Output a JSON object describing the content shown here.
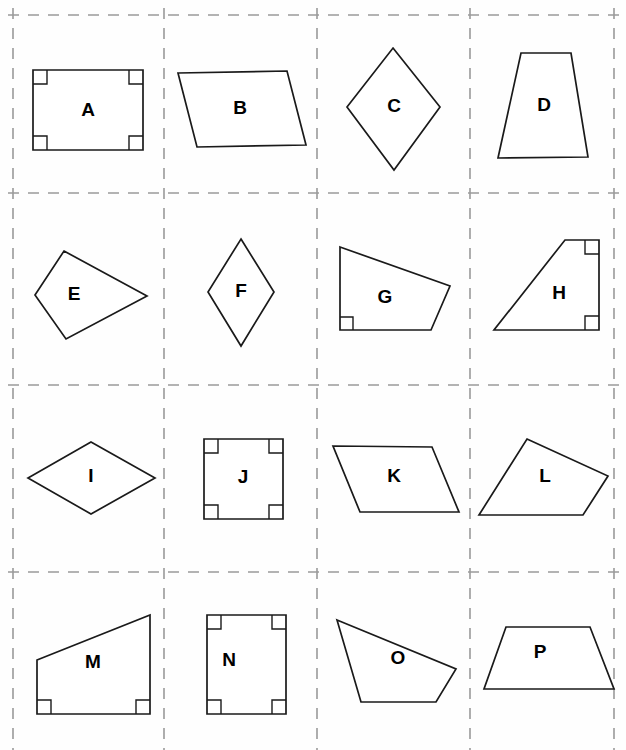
{
  "worksheet": {
    "title": "Quadrilateral shapes worksheet",
    "width": 626,
    "height": 750,
    "background_color": "#fefefe",
    "shape_stroke_color": "#1a1a1a",
    "shape_fill_color": "#ffffff",
    "grid_color": "#9a9a9a",
    "grid": {
      "columns": 4,
      "rows": 4,
      "style": "dashed",
      "vertical_lines_x": [
        13,
        164,
        317,
        470,
        614
      ],
      "horizontal_lines_y": [
        15,
        193,
        385,
        572,
        752
      ]
    }
  },
  "cells": [
    {
      "label": "A",
      "shape_name": "rectangle",
      "label_x": 88,
      "label_y": 111,
      "points": "33,70 143,70 143,150 33,150",
      "right_angles": [
        "33,84 47,84 47,70",
        "129,70 129,84 143,84",
        "33,136 47,136 47,150",
        "129,150 129,136 143,136"
      ]
    },
    {
      "label": "B",
      "shape_name": "parallelogram",
      "label_x": 240,
      "label_y": 109,
      "points": "178,73 287,71 306,145 197,147",
      "right_angles": []
    },
    {
      "label": "C",
      "shape_name": "kite",
      "label_x": 394,
      "label_y": 107,
      "points": "393,48 440,107 394,170 347,107",
      "right_angles": []
    },
    {
      "label": "D",
      "shape_name": "trapezoid",
      "label_x": 544,
      "label_y": 106,
      "points": "521,53 571,53 588,157 498,158",
      "right_angles": []
    },
    {
      "label": "E",
      "shape_name": "kite",
      "label_x": 74,
      "label_y": 295,
      "points": "64,251 147,296 66,339 35,295",
      "right_angles": []
    },
    {
      "label": "F",
      "shape_name": "rhombus",
      "label_x": 241,
      "label_y": 292,
      "points": "241,239 274,292 241,346 208,292",
      "right_angles": []
    },
    {
      "label": "G",
      "shape_name": "right-trapezoid",
      "label_x": 385,
      "label_y": 298,
      "points": "340,247 450,286 431,330 340,330",
      "right_angles": [
        "340,317 353,317 353,330"
      ]
    },
    {
      "label": "H",
      "shape_name": "right-trapezoid",
      "label_x": 559,
      "label_y": 294,
      "points": "565,240 599,240 599,330 494,330",
      "right_angles": [
        "585,240 585,254 599,254",
        "599,316 585,316 585,330"
      ]
    },
    {
      "label": "I",
      "shape_name": "rhombus",
      "label_x": 91,
      "label_y": 477,
      "points": "91,442 155,478 91,514 28,478",
      "right_angles": []
    },
    {
      "label": "J",
      "shape_name": "square",
      "label_x": 243,
      "label_y": 478,
      "points": "204,439 283,439 283,519 204,519",
      "right_angles": [
        "204,453 218,453 218,439",
        "269,439 269,453 283,453",
        "204,505 218,505 218,519",
        "269,519 269,505 283,505"
      ]
    },
    {
      "label": "K",
      "shape_name": "parallelogram",
      "label_x": 394,
      "label_y": 477,
      "points": "333,446 432,447 459,512 360,512",
      "right_angles": []
    },
    {
      "label": "L",
      "shape_name": "trapezoid",
      "label_x": 545,
      "label_y": 477,
      "points": "527,439 608,476 583,515 479,515",
      "right_angles": []
    },
    {
      "label": "M",
      "shape_name": "right-trapezoid",
      "label_x": 93,
      "label_y": 663,
      "points": "37,660 150,615 150,714 37,714",
      "right_angles": [
        "37,700 51,700 51,714",
        "136,714 136,700 150,700"
      ]
    },
    {
      "label": "N",
      "shape_name": "rectangle",
      "label_x": 229,
      "label_y": 661,
      "points": "207,615 286,615 286,714 207,714",
      "right_angles": [
        "207,629 221,629 221,615",
        "272,615 272,629 286,629",
        "207,700 221,700 221,714",
        "272,714 272,700 286,700"
      ]
    },
    {
      "label": "O",
      "shape_name": "quadrilateral",
      "label_x": 398,
      "label_y": 659,
      "points": "337,620 456,669 436,702 361,702",
      "right_angles": []
    },
    {
      "label": "P",
      "shape_name": "trapezoid",
      "label_x": 540,
      "label_y": 653,
      "points": "506,627 590,627 614,689 484,689",
      "right_angles": []
    }
  ]
}
